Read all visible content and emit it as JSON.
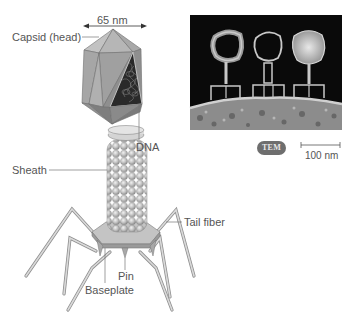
{
  "diagram": {
    "labels": {
      "width_measure": "65 nm",
      "capsid": "Capsid (head)",
      "dna": "DNA",
      "sheath": "Sheath",
      "tail_fiber": "Tail fiber",
      "pin": "Pin",
      "baseplate": "Baseplate"
    },
    "micrograph": {
      "badge": "TEM",
      "scale_bar": "100 nm"
    },
    "colors": {
      "capsid_face_light": "#b4b4b4",
      "capsid_face_mid": "#9e9e9e",
      "capsid_face_dark": "#8a8a8a",
      "dna_interior": "#2a2a2a",
      "sheath_bead": "#bdbdbd",
      "fiber": "#c8c8c8",
      "label_text": "#555555",
      "leader_line": "#777777",
      "tem_background": "#0a0a0a",
      "tem_badge": "#6e6e6e"
    }
  }
}
